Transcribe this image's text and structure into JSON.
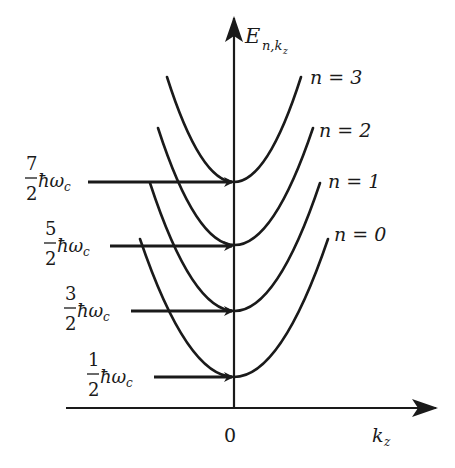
{
  "diagram": {
    "y_axis": {
      "label_main": "E",
      "label_sub": "n,k",
      "label_subsub": "z"
    },
    "x_axis": {
      "label_main": "k",
      "label_sub": "z",
      "origin_label": "0"
    },
    "levels": [
      {
        "n": 0,
        "curve_label": "n = 0",
        "energy_num": "1",
        "energy_den": "2",
        "energy_unit": "ħω",
        "energy_unit_sub": "c"
      },
      {
        "n": 1,
        "curve_label": "n = 1",
        "energy_num": "3",
        "energy_den": "2",
        "energy_unit": "ħω",
        "energy_unit_sub": "c"
      },
      {
        "n": 2,
        "curve_label": "n = 2",
        "energy_num": "5",
        "energy_den": "2",
        "energy_unit": "ħω",
        "energy_unit_sub": "c"
      },
      {
        "n": 3,
        "curve_label": "n = 3",
        "energy_num": "7",
        "energy_den": "2",
        "energy_unit": "ħω",
        "energy_unit_sub": "c"
      }
    ],
    "line_color": "#1a1a1a",
    "background": "#ffffff"
  }
}
